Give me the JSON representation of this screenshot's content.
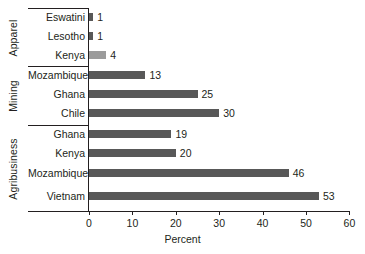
{
  "chart_data": {
    "type": "bar",
    "orientation": "horizontal",
    "title": "",
    "xlabel": "Percent",
    "ylabel": "",
    "xlim": [
      0,
      60
    ],
    "xticks": [
      0,
      10,
      20,
      30,
      40,
      50,
      60
    ],
    "grid": false,
    "legend": false,
    "bar_color": "#585858",
    "groups": [
      {
        "name": "Apparel",
        "categories": [
          "Eswatini",
          "Lesotho",
          "Kenya"
        ],
        "values": [
          1,
          1,
          4
        ]
      },
      {
        "name": "Mining",
        "categories": [
          "Mozambique",
          "Ghana",
          "Chile"
        ],
        "values": [
          13,
          25,
          30
        ]
      },
      {
        "name": "Agribusiness",
        "categories": [
          "Ghana",
          "Kenya",
          "Mozambique",
          "Vietnam"
        ],
        "values": [
          19,
          20,
          46,
          53
        ]
      }
    ],
    "categories": [
      "Eswatini",
      "Lesotho",
      "Kenya",
      "Mozambique",
      "Ghana",
      "Chile",
      "Ghana",
      "Kenya",
      "Mozambique",
      "Vietnam"
    ],
    "values": [
      1,
      1,
      4,
      13,
      25,
      30,
      19,
      20,
      46,
      53
    ]
  },
  "rows": [
    {
      "label": "Eswatini",
      "value": 1,
      "value_text": "1"
    },
    {
      "label": "Lesotho",
      "value": 1,
      "value_text": "1"
    },
    {
      "label": "Kenya",
      "value": 4,
      "value_text": "4"
    },
    {
      "label": "Mozambique",
      "value": 13,
      "value_text": "13"
    },
    {
      "label": "Ghana",
      "value": 25,
      "value_text": "25"
    },
    {
      "label": "Chile",
      "value": 30,
      "value_text": "30"
    },
    {
      "label": "Ghana",
      "value": 19,
      "value_text": "19"
    },
    {
      "label": "Kenya",
      "value": 20,
      "value_text": "20"
    },
    {
      "label": "Mozambique",
      "value": 46,
      "value_text": "46"
    },
    {
      "label": "Vietnam",
      "value": 53,
      "value_text": "53"
    }
  ],
  "groups": [
    {
      "name": "Apparel"
    },
    {
      "name": "Mining"
    },
    {
      "name": "Agribusiness"
    }
  ],
  "axis": {
    "title": "Percent",
    "ticks": [
      "0",
      "10",
      "20",
      "30",
      "40",
      "50",
      "60"
    ]
  }
}
